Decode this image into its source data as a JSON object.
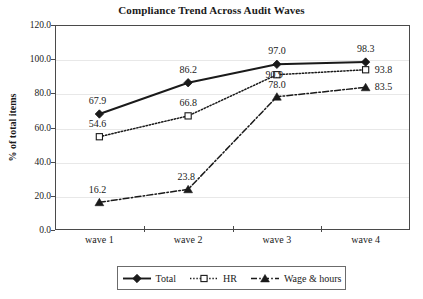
{
  "chart_data": {
    "type": "line",
    "title": "Compliance Trend Across Audit Waves",
    "xlabel": "",
    "ylabel": "% of total items",
    "categories": [
      "wave 1",
      "wave 2",
      "wave 3",
      "wave 4"
    ],
    "ylim": [
      0,
      120
    ],
    "ytick_labels": [
      "120.0",
      "100.0",
      "80.0",
      "60.0",
      "40.0",
      "20.0",
      "0.0"
    ],
    "ytick_values": [
      120,
      100,
      80,
      60,
      40,
      20,
      0
    ],
    "grid": true,
    "legend_position": "bottom",
    "series": [
      {
        "name": "Total",
        "values": [
          67.9,
          86.2,
          97.0,
          98.3
        ],
        "labels": [
          "67.9",
          "86.2",
          "97.0",
          "98.3"
        ],
        "marker": "filled-diamond",
        "line_style": "solid",
        "color": "#1a1a1a"
      },
      {
        "name": "HR",
        "values": [
          54.6,
          66.8,
          90.9,
          93.8
        ],
        "labels": [
          "54.6",
          "66.8",
          "90.9",
          "93.8"
        ],
        "marker": "open-square",
        "line_style": "dotted",
        "color": "#1a1a1a"
      },
      {
        "name": "Wage & hours",
        "values": [
          16.2,
          23.8,
          78.0,
          83.5
        ],
        "labels": [
          "16.2",
          "23.8",
          "78.0",
          "83.5"
        ],
        "marker": "filled-triangle",
        "line_style": "dash-dot",
        "color": "#1a1a1a"
      }
    ]
  },
  "legend": {
    "entries": [
      {
        "label": "Total"
      },
      {
        "label": "HR"
      },
      {
        "label": "Wage & hours"
      }
    ]
  },
  "colors": {
    "ink": "#1a1a1a",
    "axis": "#4a4a4a",
    "grid": "#e8e8e8",
    "legend_border": "#6b6b6b",
    "background": "#ffffff"
  }
}
